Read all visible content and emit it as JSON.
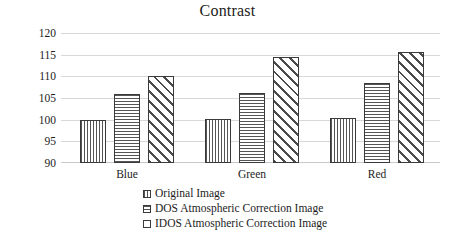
{
  "chart_data": {
    "type": "bar",
    "title": "Contrast",
    "xlabel": "",
    "ylabel": "",
    "categories": [
      "Blue",
      "Green",
      "Red"
    ],
    "series": [
      {
        "name": "Original Image",
        "pattern": "vertical-lines",
        "values": [
          100.0,
          100.2,
          100.4
        ]
      },
      {
        "name": "DOS Atmospheric Correction Image",
        "pattern": "horizontal-lines",
        "values": [
          106.0,
          106.2,
          108.5
        ]
      },
      {
        "name": "IDOS Atmospheric Correction Image",
        "pattern": "diagonal-hatch",
        "values": [
          110.1,
          114.5,
          115.6
        ]
      }
    ],
    "ylim": [
      90,
      120
    ],
    "ytick_step": 5,
    "yticks": [
      "120",
      "115",
      "110",
      "105",
      "100",
      "95",
      "90"
    ],
    "grid": true,
    "legend_position": "bottom-center",
    "colors": {
      "bar_outline": "#3a3a3a",
      "bar_fill": "#ffffff",
      "hatch": "#555555",
      "gridline": "#d8d8d8",
      "text": "#1c1c1c",
      "background": "#ffffff"
    }
  }
}
